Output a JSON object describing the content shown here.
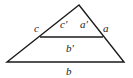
{
  "diagram": {
    "type": "similar-triangles",
    "stroke_color": "#1a1a1a",
    "background": "#ffffff",
    "labels": {
      "c": "c",
      "c_prime": "c′",
      "a_prime": "a′",
      "a": "a",
      "b_prime": "b′",
      "b": "b"
    }
  }
}
